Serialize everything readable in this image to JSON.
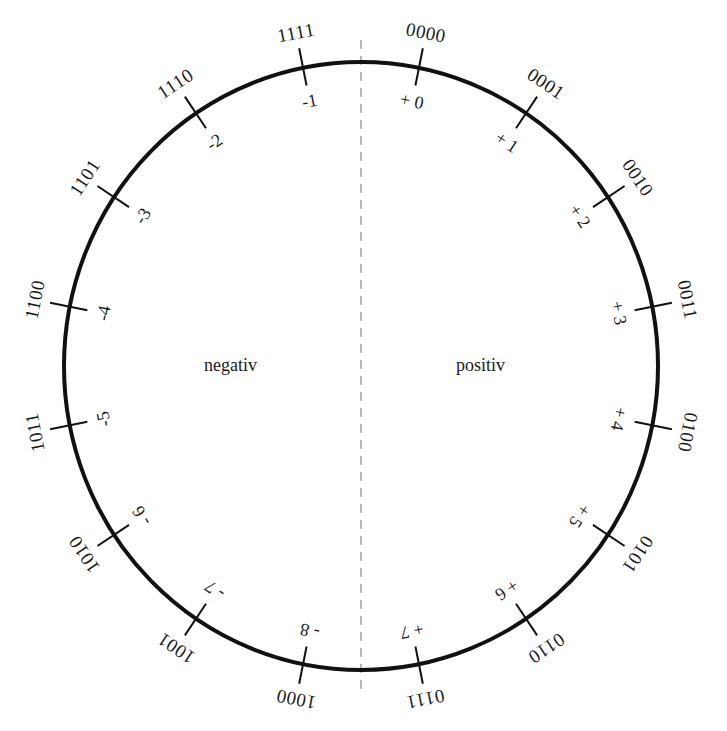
{
  "diagram": {
    "type": "twos-complement-number-circle",
    "bits": 4,
    "halves": {
      "left_label": "negativ",
      "right_label": "positiv"
    },
    "positions": [
      {
        "binary": "0000",
        "value": "+ 0"
      },
      {
        "binary": "0001",
        "value": "+ 1"
      },
      {
        "binary": "0010",
        "value": "+ 2"
      },
      {
        "binary": "0011",
        "value": "+ 3"
      },
      {
        "binary": "0100",
        "value": "+ 4"
      },
      {
        "binary": "0101",
        "value": "+ 5"
      },
      {
        "binary": "0110",
        "value": "+ 6"
      },
      {
        "binary": "0111",
        "value": "+ 7"
      },
      {
        "binary": "1000",
        "value": "- 8"
      },
      {
        "binary": "1001",
        "value": "- 7"
      },
      {
        "binary": "1010",
        "value": "- 6"
      },
      {
        "binary": "1011",
        "value": "-5"
      },
      {
        "binary": "1100",
        "value": "-4"
      },
      {
        "binary": "1101",
        "value": "-3"
      },
      {
        "binary": "1110",
        "value": "-2"
      },
      {
        "binary": "1111",
        "value": "-1"
      }
    ],
    "colors": {
      "circle": "#111111",
      "divider": "#a0a0a0",
      "text": "#1a1a1a"
    }
  }
}
